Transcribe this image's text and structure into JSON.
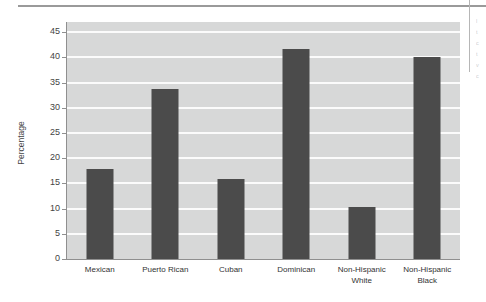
{
  "page": {
    "ghost_text_lines": [
      "l",
      "t",
      "c",
      "t",
      "v",
      "c"
    ]
  },
  "chart_data": {
    "type": "bar",
    "title": "",
    "subtitle": "",
    "xlabel": "",
    "ylabel": "Percentage",
    "categories": [
      "Mexican",
      "Puerto Rican",
      "Cuban",
      "Dominican",
      "Non-Hispanic White",
      "Non-Hispanic Black"
    ],
    "category_lines": [
      [
        "Mexican"
      ],
      [
        "Puerto Rican"
      ],
      [
        "Cuban"
      ],
      [
        "Dominican"
      ],
      [
        "Non-Hispanic",
        "White"
      ],
      [
        "Non-Hispanic",
        "Black"
      ]
    ],
    "values": [
      17.8,
      33.8,
      15.8,
      41.6,
      10.4,
      40.1
    ],
    "ylim": [
      0,
      47
    ],
    "yticks": [
      0,
      5,
      10,
      15,
      20,
      25,
      30,
      35,
      40,
      45
    ],
    "ytick_labels": [
      "0",
      "5",
      "10",
      "15",
      "20",
      "25",
      "30",
      "35",
      "40",
      "45"
    ],
    "grid": true,
    "grid_axis": "y",
    "legend": false,
    "legend_position": "none",
    "bar_color": "#4b4b4b",
    "plot_background": "#d7d8d8",
    "gridline_color": "#fbfbfb",
    "axis_color": "#8f8f8f"
  }
}
